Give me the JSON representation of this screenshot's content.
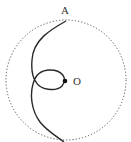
{
  "diagram": {
    "type": "geometry",
    "labels": {
      "top_point": "A",
      "center_point": "O"
    },
    "elements": [
      {
        "kind": "circle",
        "style": "dotted",
        "description": "circle centered at O"
      },
      {
        "kind": "curve",
        "style": "solid",
        "description": "path from A down the left side, looping through O, continuing to the bottom of the circle"
      },
      {
        "kind": "point",
        "name": "O",
        "style": "filled dot"
      }
    ],
    "colors": {
      "stroke": "#2a2a2a",
      "dotted": "#555555",
      "label": "#333333"
    }
  }
}
